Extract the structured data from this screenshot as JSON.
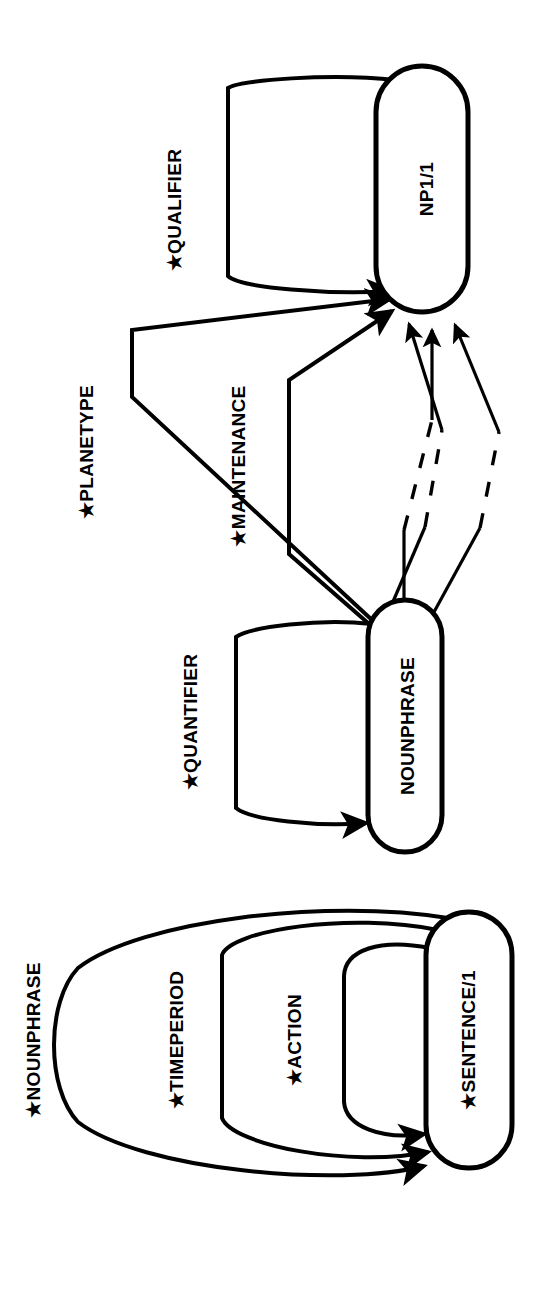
{
  "diagram": {
    "orientation": "rotated-90-ccw",
    "background_color": "#ffffff",
    "line_color": "#000000",
    "nodes": [
      {
        "id": "np1",
        "label": "NP1/1",
        "shape": "stadium"
      },
      {
        "id": "nounphrase",
        "label": "NOUNPHRASE",
        "shape": "stadium"
      },
      {
        "id": "sentence",
        "label": "★SENTENCE/1",
        "shape": "stadium"
      }
    ],
    "self_loops": [
      {
        "id": "qualifier",
        "label": "★QUALIFIER",
        "on_node": "np1"
      },
      {
        "id": "quantifier",
        "label": "★QUANTIFIER",
        "on_node": "nounphrase"
      },
      {
        "id": "nounphrase_loop",
        "label": "★NOUNPHRASE",
        "on_node": "sentence"
      },
      {
        "id": "timeperiod",
        "label": "★TIMEPERIOD",
        "on_node": "sentence"
      },
      {
        "id": "action",
        "label": "★ACTION",
        "on_node": "sentence"
      }
    ],
    "arcs": [
      {
        "id": "planetype",
        "label": "★PLANETYPE",
        "from": "nounphrase",
        "to": "np1",
        "style": "solid"
      },
      {
        "id": "maintenance",
        "label": "★MAINTENANCE",
        "from": "nounphrase",
        "to": "np1",
        "style": "solid"
      },
      {
        "id": "elided-left",
        "label": "",
        "from": "nounphrase",
        "to": "np1",
        "style": "dashed"
      },
      {
        "id": "elided-center",
        "label": "",
        "from": "nounphrase",
        "to": "np1",
        "style": "dashed"
      },
      {
        "id": "elided-right",
        "label": "",
        "from": "nounphrase",
        "to": "np1",
        "style": "dashed"
      }
    ]
  }
}
